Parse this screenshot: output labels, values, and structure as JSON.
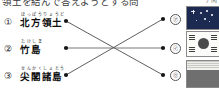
{
  "document": {
    "type": "matching-exercise",
    "header_text_clipped": "領土を結んで答えようとする問",
    "header_right_clipped": "ア問",
    "language": "ja"
  },
  "left_column": {
    "items": [
      {
        "marker": "①",
        "furigana": "ほっぽうりょうど",
        "term": "北方領土",
        "node": {
          "x": 66,
          "y": 21
        }
      },
      {
        "marker": "②",
        "furigana": "たけしま",
        "term": "竹島",
        "node": {
          "x": 66,
          "y": 48
        }
      },
      {
        "marker": "③",
        "furigana": "せんかくしょとう",
        "term": "尖閣諸島",
        "node": {
          "x": 66,
          "y": 75
        }
      }
    ]
  },
  "right_column": {
    "options": [
      {
        "marker": "㋐",
        "icon": "flag-navy-stars-icon",
        "flag_name": "navy flag with white stars",
        "node": {
          "x": 163,
          "y": 19
        }
      },
      {
        "marker": "㋑",
        "icon": "flag-south-korea-icon",
        "flag_name": "South Korea taegukgi flag",
        "node": {
          "x": 163,
          "y": 48
        }
      },
      {
        "marker": "㋒",
        "icon": "flag-striped-icon",
        "flag_name": "striped flag with dark band",
        "node": {
          "x": 163,
          "y": 75
        }
      }
    ]
  },
  "connections": [
    {
      "from": "①",
      "to": "㋒",
      "style": "diagonal-down"
    },
    {
      "from": "②",
      "to": "㋑",
      "style": "horizontal"
    },
    {
      "from": "③",
      "to": "㋐",
      "style": "diagonal-up"
    }
  ],
  "colors": {
    "line": "#4d4d4d",
    "dot": "#161616",
    "flag_navy": "#1c2a52",
    "flag_border": "#8a8a8a",
    "text": "#0d0d0d"
  }
}
